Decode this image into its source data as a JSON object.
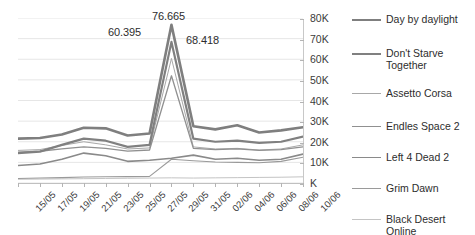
{
  "chart_data": {
    "type": "line",
    "title": "",
    "xlabel": "",
    "ylabel": "",
    "ylim": [
      0,
      80000
    ],
    "grid": true,
    "legend_position": "right",
    "axis_position": "right",
    "y_ticks": [
      {
        "value": 80000,
        "label": "80K"
      },
      {
        "value": 70000,
        "label": "70K"
      },
      {
        "value": 60000,
        "label": "60K"
      },
      {
        "value": 50000,
        "label": "50K"
      },
      {
        "value": 40000,
        "label": "40K"
      },
      {
        "value": 30000,
        "label": "30K"
      },
      {
        "value": 20000,
        "label": "20K"
      },
      {
        "value": 10000,
        "label": "10K"
      },
      {
        "value": 0,
        "label": "K"
      }
    ],
    "categories": [
      "15/05",
      "17/05",
      "19/05",
      "21/05",
      "23/05",
      "25/05",
      "27/05",
      "29/05",
      "31/05",
      "02/06",
      "04/06",
      "06/06",
      "08/06",
      "10/06"
    ],
    "annotations": [
      {
        "text": "60.395",
        "series": "Assetto Corsa",
        "value": 60395
      },
      {
        "text": "76.665",
        "series": "Day by daylight",
        "value": 76665
      },
      {
        "text": "68.418",
        "series": "Don't Starve Together",
        "value": 68418
      }
    ],
    "series": [
      {
        "name": "Day by daylight",
        "color": "#7f7f7f",
        "width": 2.6,
        "values": [
          21500,
          21800,
          23500,
          26800,
          26500,
          23000,
          24000,
          76665,
          27500,
          26000,
          28000,
          24500,
          25500,
          27000
        ]
      },
      {
        "name": "Don't Starve Together",
        "color": "#808080",
        "width": 2.2,
        "values": [
          14500,
          15200,
          18500,
          21500,
          20500,
          17500,
          18500,
          68418,
          21500,
          20000,
          20500,
          19500,
          20000,
          22500
        ]
      },
      {
        "name": "Assetto Corsa",
        "color": "#a8a8a8",
        "width": 1.0,
        "values": [
          15800,
          16200,
          18200,
          20000,
          18500,
          16500,
          17000,
          60395,
          17500,
          16500,
          16800,
          16000,
          16500,
          18500
        ]
      },
      {
        "name": "Endles Space 2",
        "color": "#909090",
        "width": 1.3,
        "values": [
          15000,
          15400,
          16500,
          17500,
          16800,
          15500,
          16000,
          52000,
          16800,
          16200,
          16500,
          15800,
          16200,
          17500
        ]
      },
      {
        "name": "Left 4 Dead 2",
        "color": "#8a8a8a",
        "width": 1.6,
        "values": [
          8500,
          9200,
          11500,
          14500,
          13200,
          10500,
          11000,
          12000,
          13500,
          11500,
          12000,
          11000,
          11500,
          14000
        ]
      },
      {
        "name": "Grim Dawn",
        "color": "#9a9a9a",
        "width": 1.1,
        "values": [
          2200,
          2400,
          2600,
          2900,
          3000,
          3100,
          3200,
          11500,
          10800,
          10200,
          10000,
          9800,
          10500,
          12500
        ]
      },
      {
        "name": "Black Desert Online",
        "color": "#c4c4c4",
        "width": 1.0,
        "values": [
          1800,
          1900,
          2000,
          2100,
          2200,
          2300,
          2400,
          2500,
          2400,
          2500,
          2600,
          2700,
          2800,
          3000
        ]
      }
    ]
  }
}
